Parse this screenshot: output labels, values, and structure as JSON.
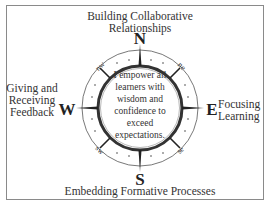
{
  "diagram": {
    "type": "compass",
    "center_statement": "I empower all learners with wisdom and confidence to exceed expectations.",
    "cardinal_letters": {
      "north": "N",
      "south": "S",
      "east": "E",
      "west": "W"
    },
    "intercardinal_letters": {
      "nw": "nw",
      "ne": "ne",
      "sw": "sw",
      "se": "se"
    },
    "labels": {
      "north": "Building Collaborative Relationships",
      "north_line1": "Building Collaborative",
      "north_line2": "Relationships",
      "south": "Embedding Formative Processes",
      "west_line1": "Giving and",
      "west_line2": "Receiving",
      "west_line3": "Feedback",
      "east_line1": "Focusing",
      "east_line2": "Learning"
    },
    "colors": {
      "border": "#8a8a8a",
      "ink": "#222222",
      "background": "#ffffff"
    }
  }
}
